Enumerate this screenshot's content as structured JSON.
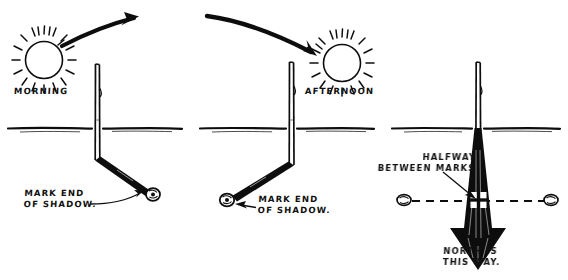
{
  "illustration": {
    "title": "Shadow Stick Method for Finding North",
    "width": 568,
    "height": 280,
    "background_color": "#ffffff",
    "ink_color": "#111111"
  },
  "panels": [
    {
      "id": "panel-morning",
      "sun_label": "MORNING",
      "annotation": "MARK END\nOF SHADOW.",
      "sun_position": "upper-left",
      "sun_motion_arrow": "curved arrow sweeping up and to the right",
      "shadow_direction": "down-right",
      "marker": "pebble at shadow tip"
    },
    {
      "id": "panel-afternoon",
      "sun_label": "AFTERNOON",
      "annotation": "MARK END\nOF SHADOW.",
      "sun_position": "upper-right",
      "sun_motion_arrow": "curved arrow sweeping down and to the right into the sun",
      "shadow_direction": "down-left",
      "marker": "pebble at shadow tip"
    },
    {
      "id": "panel-north",
      "halfway_label": "HALFWAY\nBETWEEN MARKS",
      "north_label": "NORTH IS\nTHIS WAY.",
      "markers": [
        "pebble left",
        "pebble right"
      ],
      "midpoint_marker": "cross",
      "connector": "dashed line between marks",
      "north_arrow_direction": "down"
    }
  ],
  "icons": {
    "sun": "sun-icon",
    "stick": "stick-icon",
    "pebble": "pebble-icon",
    "cross": "cross-marker-icon",
    "ground": "ground-line-icon",
    "arrow_curved": "curved-arrow-icon",
    "arrow_north": "north-arrow-icon",
    "pointer": "pointer-arrow-icon",
    "dashed": "dashed-line-icon"
  }
}
